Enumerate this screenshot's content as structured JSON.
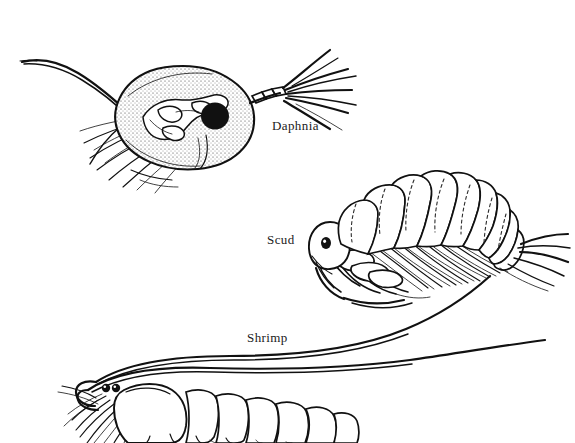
{
  "plate": {
    "title": "Freshwater Invertebrates",
    "background_color": "#ffffff",
    "ink_color": "#111111",
    "width": 575,
    "height": 443,
    "style": "black-and-white pen-and-ink scientific line drawing"
  },
  "labels": {
    "daphnia": "Daphnia",
    "scud": "Scud",
    "shrimp": "Shrimp"
  },
  "figures": [
    {
      "id": "daphnia",
      "label": "Daphnia",
      "common_name": "Water flea",
      "position": "top-left",
      "orientation": "facing right",
      "features": "stippled oval carapace, single large black compound eye, branched biramous antenna to the right, long curving tail spine to the left, feathery thoracic appendages below"
    },
    {
      "id": "scud",
      "label": "Scud",
      "common_name": "Amphipod",
      "position": "middle-right",
      "orientation": "facing left",
      "features": "arched segmented body with about eleven dorsal segments, dark eye on head, numerous ventral legs, bristly tail uropods to the right"
    },
    {
      "id": "shrimp",
      "label": "Shrimp",
      "common_name": "Freshwater shrimp",
      "position": "bottom-left, cropped by page edge",
      "orientation": "facing left",
      "features": "two long antennae sweeping up and right, two small dark eyes, smooth carapace, segmented abdomen, dense fringe of swimmerets below"
    }
  ]
}
